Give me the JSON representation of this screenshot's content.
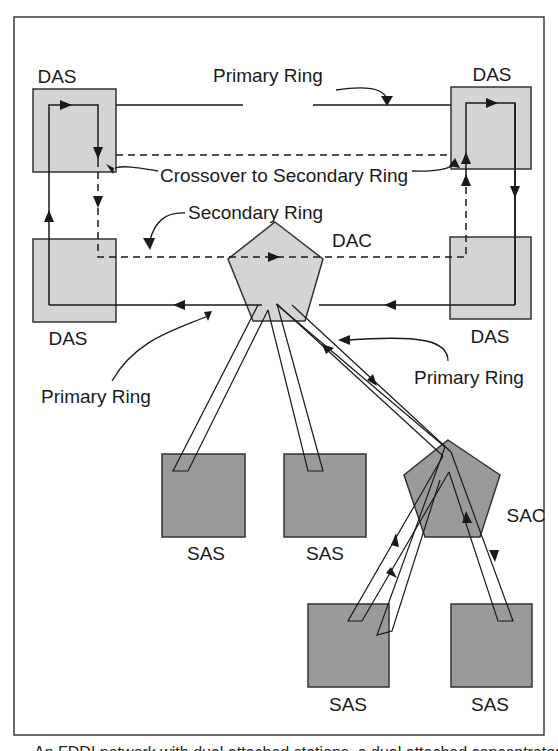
{
  "figure": {
    "type": "FDDI network topology diagram",
    "caption_partial": "An FDDI network with dual attached stations, a dual attached concentrator and single attached stations"
  },
  "colors": {
    "frame": "#3a3a3a",
    "line": "#1a1a1a",
    "das_fill": "#d4d4d4",
    "dac_fill": "#d4d4d4",
    "sas_fill": "#9a9a9a",
    "sac_fill": "#9a9a9a",
    "background": "#ffffff"
  },
  "nodes": {
    "das_top_left": {
      "label": "DAS"
    },
    "das_top_right": {
      "label": "DAS"
    },
    "das_bottom_left": {
      "label": "DAS"
    },
    "das_bottom_right": {
      "label": "DAS"
    },
    "dac": {
      "label": "DAC"
    },
    "sac": {
      "label": "SAC"
    },
    "sas_1": {
      "label": "SAS"
    },
    "sas_2": {
      "label": "SAS"
    },
    "sas_3": {
      "label": "SAS"
    },
    "sas_4": {
      "label": "SAS"
    }
  },
  "annotations": {
    "primary_ring_top": "Primary Ring",
    "crossover": "Crossover to Secondary Ring",
    "secondary_ring": "Secondary Ring",
    "primary_ring_left": "Primary Ring",
    "primary_ring_right": "Primary Ring"
  },
  "legend_semantics": {
    "solid_line": "Primary Ring",
    "dashed_line": "Secondary Ring"
  }
}
